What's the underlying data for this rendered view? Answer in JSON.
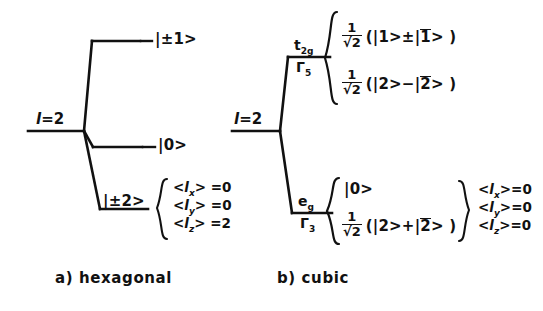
{
  "figure": {
    "background_color": "#ffffff",
    "line_color": "#111111"
  },
  "panels": [
    {
      "id": "hexagonal",
      "caption": "a) hexagonal",
      "origin_label": "l = 2",
      "origin_label_parts": {
        "symbol": "l",
        "equals": "=",
        "value": "2"
      },
      "levels": [
        {
          "id": "hex-up",
          "ket": "|±1>",
          "sublabels": [],
          "states": [],
          "expectations": []
        },
        {
          "id": "hex-mid",
          "ket": "|0>",
          "sublabels": [],
          "states": [],
          "expectations": []
        },
        {
          "id": "hex-down",
          "ket": "|±2>",
          "sublabels": [],
          "states": [],
          "expectations": [
            {
              "operator": "l",
              "subscript": "x",
              "value": "0"
            },
            {
              "operator": "l",
              "subscript": "y",
              "value": "0"
            },
            {
              "operator": "l",
              "subscript": "z",
              "value": "2"
            }
          ]
        }
      ]
    },
    {
      "id": "cubic",
      "caption": "b) cubic",
      "origin_label": "l = 2",
      "origin_label_parts": {
        "symbol": "l",
        "equals": "=",
        "value": "2"
      },
      "levels": [
        {
          "id": "cubic-t2g",
          "term_symbol": "t",
          "term_subscript": "2g",
          "irrep": "Γ",
          "irrep_subscript": "5",
          "states": [
            {
              "prefactor_num": "1",
              "prefactor_den": "√2",
              "expression_open": "(|1>",
              "sign": "±",
              "expression_close": "|1̅>)",
              "bar_digit": "1",
              "text": "1/√2 (|1> ± |1̅>)"
            },
            {
              "prefactor_num": "1",
              "prefactor_den": "√2",
              "expression_open": "(|2>",
              "sign": "−",
              "expression_close": "|2̅>)",
              "bar_digit": "2",
              "text": "1/√2 (|2> − |2̅>)"
            }
          ],
          "expectations": []
        },
        {
          "id": "cubic-eg",
          "term_symbol": "e",
          "term_subscript": "g",
          "irrep": "Γ",
          "irrep_subscript": "3",
          "states": [
            {
              "prefactor_num": "",
              "prefactor_den": "",
              "plain": "|0>",
              "text": "|0>"
            },
            {
              "prefactor_num": "1",
              "prefactor_den": "√2",
              "expression_open": "(|2>",
              "sign": "+",
              "expression_close": "|2̅>)",
              "bar_digit": "2",
              "text": "1/√2 (|2> + |2̅>)"
            }
          ],
          "expectations": [
            {
              "operator": "l",
              "subscript": "x",
              "value": "0"
            },
            {
              "operator": "l",
              "subscript": "y",
              "value": "0"
            },
            {
              "operator": "l",
              "subscript": "z",
              "value": "0"
            }
          ]
        }
      ]
    }
  ],
  "glyphs": {
    "brace_left": "{",
    "brace_right": "}",
    "radical": "√",
    "plus_minus": "±",
    "minus": "−",
    "plus": "+"
  }
}
